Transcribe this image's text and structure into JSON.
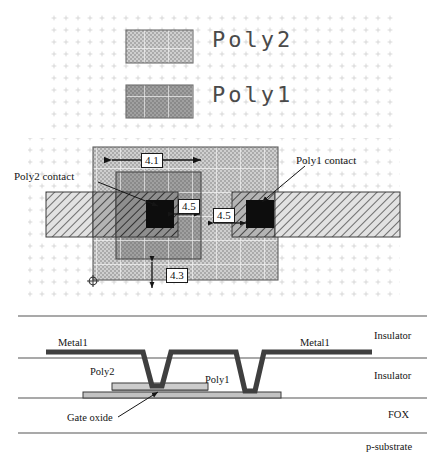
{
  "figure": {
    "colors": {
      "poly2_fill": "#c8c8c8",
      "poly1_fill": "#9a9a9a",
      "metal1_fill": "#d8d8d8",
      "contact_fill": "#101010",
      "outline": "#2a2a2a",
      "grid_dot": "#c9c9c9",
      "metal1_xsec": "#4a4a4a",
      "poly_xsec": "#b8b8b8",
      "line": "#3a3a3a"
    }
  },
  "legend": {
    "items": [
      {
        "label": "Poly2",
        "swatch": "poly2-swatch"
      },
      {
        "label": "Poly1",
        "swatch": "poly1-swatch"
      }
    ]
  },
  "layout": {
    "annotations": [
      {
        "id": "poly2-contact",
        "text": "Poly2 contact"
      },
      {
        "id": "poly1-contact",
        "text": "Poly1 contact"
      }
    ],
    "dimensions": [
      {
        "id": "dim-4-1",
        "value": "4.1",
        "orientation": "horizontal"
      },
      {
        "id": "dim-4-5-left",
        "value": "4.5",
        "orientation": "horizontal"
      },
      {
        "id": "dim-4-5-right",
        "value": "4.5",
        "orientation": "horizontal"
      },
      {
        "id": "dim-4-3",
        "value": "4.3",
        "orientation": "vertical"
      }
    ]
  },
  "cross_section": {
    "layer_labels": [
      {
        "id": "insulator-top",
        "text": "Insulator"
      },
      {
        "id": "insulator-mid",
        "text": "Insulator"
      },
      {
        "id": "fox",
        "text": "FOX"
      },
      {
        "id": "p-substrate",
        "text": "p-substrate"
      }
    ],
    "feature_labels": [
      {
        "id": "metal1-left",
        "text": "Metal1"
      },
      {
        "id": "metal1-right",
        "text": "Metal1"
      },
      {
        "id": "poly2",
        "text": "Poly2"
      },
      {
        "id": "poly1",
        "text": "Poly1"
      },
      {
        "id": "gate-oxide",
        "text": "Gate oxide"
      }
    ]
  }
}
